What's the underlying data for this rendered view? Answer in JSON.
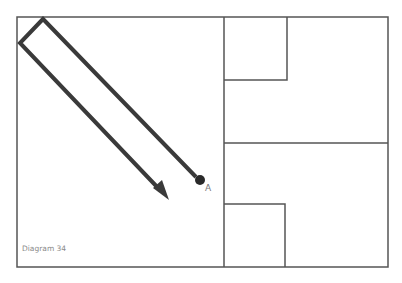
{
  "diagram": {
    "caption": "Diagram 34",
    "point_label": "A",
    "colors": {
      "outline": "#555555",
      "path": "#3a3a3a",
      "background": "#ffffff",
      "caption": "#8a8a8a"
    }
  }
}
